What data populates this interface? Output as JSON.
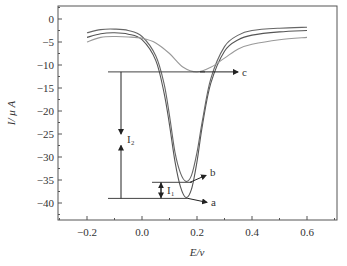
{
  "chart_data": {
    "type": "line",
    "title": "",
    "xlabel": "E/v",
    "ylabel": "I/ μ A",
    "xlim": [
      -0.3,
      0.7
    ],
    "ylim": [
      -43,
      3
    ],
    "xticks": [
      "-0.2",
      "0.0",
      "0.2",
      "0.4",
      "0.6"
    ],
    "yticks": [
      "0",
      "-5",
      "-10",
      "-15",
      "-20",
      "-25",
      "-30",
      "-35",
      "-40"
    ],
    "grid": false,
    "legend": "none (curves labeled by annotation arrows a, b, c)",
    "series": [
      {
        "name": "a",
        "x": [
          -0.2,
          -0.15,
          -0.1,
          -0.05,
          0.0,
          0.05,
          0.08,
          0.1,
          0.12,
          0.14,
          0.16,
          0.18,
          0.2,
          0.22,
          0.25,
          0.3,
          0.35,
          0.4,
          0.5,
          0.6
        ],
        "y": [
          -4.0,
          -3.2,
          -3.0,
          -3.3,
          -4.5,
          -9,
          -16,
          -23,
          -31,
          -36.5,
          -38.8,
          -37,
          -31,
          -23,
          -14,
          -7,
          -4.5,
          -3.5,
          -2.8,
          -2.5
        ]
      },
      {
        "name": "b",
        "x": [
          -0.2,
          -0.15,
          -0.1,
          -0.05,
          0.0,
          0.05,
          0.08,
          0.1,
          0.12,
          0.14,
          0.16,
          0.18,
          0.2,
          0.22,
          0.25,
          0.3,
          0.35,
          0.4,
          0.5,
          0.6
        ],
        "y": [
          -3.0,
          -2.3,
          -2.2,
          -2.5,
          -3.8,
          -8,
          -14,
          -21,
          -29,
          -33.5,
          -35.3,
          -34,
          -29,
          -22,
          -13,
          -6,
          -3.5,
          -2.5,
          -2.0,
          -1.8
        ]
      },
      {
        "name": "c",
        "x": [
          -0.2,
          -0.15,
          -0.1,
          -0.05,
          0.0,
          0.05,
          0.1,
          0.15,
          0.2,
          0.25,
          0.3,
          0.35,
          0.4,
          0.5,
          0.6
        ],
        "y": [
          -5.0,
          -4.0,
          -3.8,
          -3.9,
          -4.2,
          -5.2,
          -7.5,
          -10.5,
          -11.5,
          -10.5,
          -8.5,
          -6.5,
          -5.5,
          -4.5,
          -4.0
        ]
      }
    ],
    "annotations": [
      {
        "label": "a",
        "level": -39
      },
      {
        "label": "b",
        "level": -35.5
      },
      {
        "label": "c",
        "level": -11.5
      },
      {
        "label": "I1",
        "from": -39,
        "to": -35.5
      },
      {
        "label": "I2",
        "from": -39,
        "to": -11.5
      }
    ]
  }
}
